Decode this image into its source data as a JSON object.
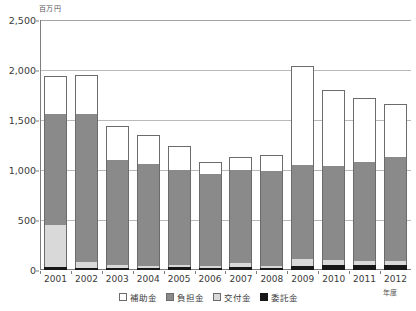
{
  "chart_data": {
    "type": "bar",
    "subtype": "stacked-vertical",
    "title": "",
    "unit_label": "百万円",
    "xlabel": "年度",
    "ylabel": "",
    "ylim": [
      0,
      2500
    ],
    "yticks": [
      0,
      500,
      1000,
      1500,
      2000,
      2500
    ],
    "ytick_labels": [
      "0",
      "500",
      "1,000",
      "1,500",
      "2,000",
      "2,500"
    ],
    "grid": "horizontal",
    "legend_position": "bottom-center",
    "categories": [
      "2001",
      "2002",
      "2003",
      "2004",
      "2005",
      "2006",
      "2007",
      "2008",
      "2009",
      "2010",
      "2011",
      "2012"
    ],
    "stack_order_bottom_to_top": [
      "委託金",
      "交付金",
      "負担金",
      "補助金"
    ],
    "series": [
      {
        "name": "委託金",
        "color": "#171717",
        "values": [
          30,
          20,
          25,
          25,
          30,
          25,
          30,
          25,
          45,
          50,
          55,
          50
        ]
      },
      {
        "name": "交付金",
        "color": "#d9d9d9",
        "values": [
          420,
          60,
          25,
          20,
          20,
          15,
          45,
          20,
          65,
          55,
          40,
          40
        ]
      },
      {
        "name": "負担金",
        "color": "#8a8a8a",
        "values": [
          1110,
          1480,
          1055,
          1015,
          950,
          920,
          925,
          950,
          945,
          935,
          985,
          1045
        ]
      },
      {
        "name": "補助金",
        "color": "#ffffff",
        "values": [
          385,
          390,
          340,
          290,
          240,
          125,
          135,
          155,
          985,
          760,
          645,
          530
        ]
      }
    ],
    "totals": [
      1945,
      1950,
      1445,
      1350,
      1240,
      1085,
      1135,
      1150,
      2040,
      1800,
      1725,
      1665
    ]
  },
  "legend": {
    "items": [
      {
        "label": "補助金",
        "swatch": "white-square-icon"
      },
      {
        "label": "負担金",
        "swatch": "darkgray-square-icon"
      },
      {
        "label": "交付金",
        "swatch": "lightgray-square-icon"
      },
      {
        "label": "委託金",
        "swatch": "black-square-icon"
      }
    ]
  },
  "colors": {
    "hojokin": "#ffffff",
    "futankin": "#8a8a8a",
    "kofukin": "#d9d9d9",
    "itakukin": "#171717",
    "axis": "#7d7d7d",
    "grid": "#b9b9b9",
    "text": "#3a3a3a"
  }
}
